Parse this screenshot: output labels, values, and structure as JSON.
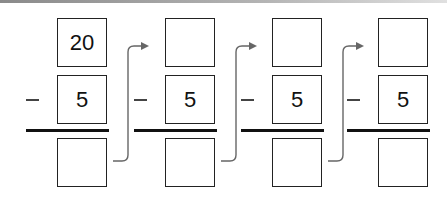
{
  "diagram": {
    "type": "repeated-subtraction",
    "operator": "−",
    "columns": [
      {
        "minuend": "20",
        "subtrahend": "5",
        "difference": ""
      },
      {
        "minuend": "",
        "subtrahend": "5",
        "difference": ""
      },
      {
        "minuend": "",
        "subtrahend": "5",
        "difference": ""
      },
      {
        "minuend": "",
        "subtrahend": "5",
        "difference": ""
      }
    ],
    "colors": {
      "box_border": "#222222",
      "rule": "#111111",
      "arrow": "#666666",
      "minus": "#444444"
    }
  }
}
